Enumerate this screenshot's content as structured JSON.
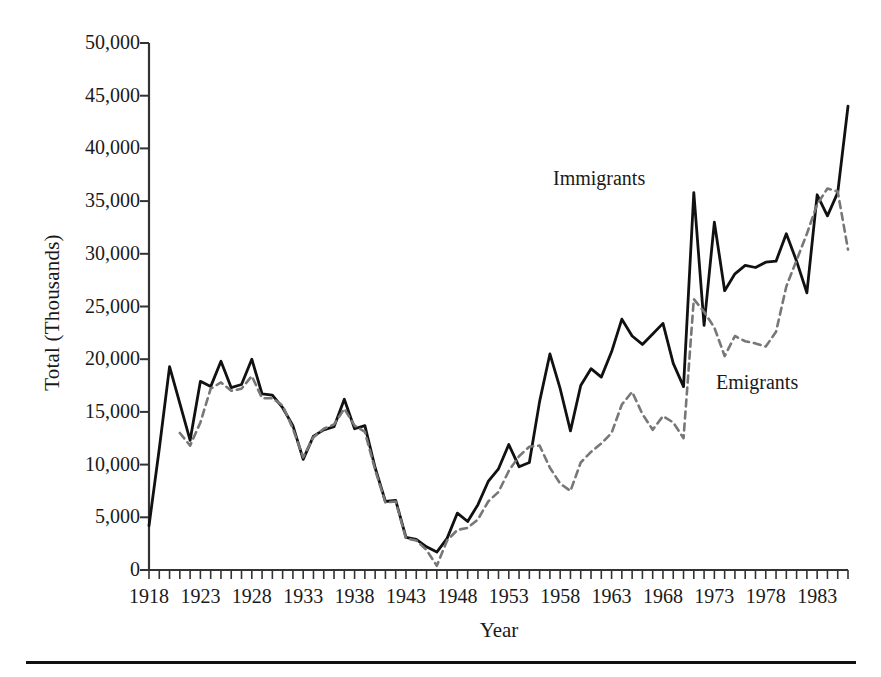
{
  "axes": {
    "ylabel": "Total (Thousands)",
    "xlabel": "Year",
    "y_ticks": [
      "0",
      "5,000",
      "10,000",
      "15,000",
      "20,000",
      "25,000",
      "30,000",
      "35,000",
      "40,000",
      "45,000",
      "50,000"
    ],
    "x_ticks": [
      "1918",
      "1923",
      "1928",
      "1933",
      "1938",
      "1943",
      "1948",
      "1953",
      "1958",
      "1963",
      "1968",
      "1973",
      "1978",
      "1983"
    ]
  },
  "annotations": {
    "immigrants": "Immigrants",
    "emigrants": "Emigrants"
  },
  "colors": {
    "immigrants_line": "#111111",
    "emigrants_line": "#777777",
    "axis": "#333333",
    "background": "#ffffff"
  },
  "chart_data": {
    "type": "line",
    "title": "",
    "xlabel": "Year",
    "ylabel": "Total (Thousands)",
    "xlim": [
      1918,
      1986
    ],
    "ylim": [
      0,
      50000
    ],
    "ytick_step": 5000,
    "xtick_step_major": 5,
    "xtick_step_minor": 1,
    "grid": false,
    "legend": "inline-annotations",
    "x": [
      1918,
      1919,
      1920,
      1921,
      1922,
      1923,
      1924,
      1925,
      1926,
      1927,
      1928,
      1929,
      1930,
      1931,
      1932,
      1933,
      1934,
      1935,
      1936,
      1937,
      1938,
      1939,
      1940,
      1941,
      1942,
      1943,
      1944,
      1945,
      1946,
      1947,
      1948,
      1949,
      1950,
      1951,
      1952,
      1953,
      1954,
      1955,
      1956,
      1957,
      1958,
      1959,
      1960,
      1961,
      1962,
      1963,
      1964,
      1965,
      1966,
      1967,
      1968,
      1969,
      1970,
      1971,
      1972,
      1973,
      1974,
      1975,
      1976,
      1977,
      1978,
      1979,
      1980,
      1981,
      1982,
      1983,
      1984,
      1985,
      1986
    ],
    "series": [
      {
        "name": "Immigrants",
        "style": "solid",
        "color": "#111111",
        "values": [
          4200,
          11500,
          19300,
          15800,
          12300,
          17900,
          17400,
          19800,
          17300,
          17600,
          20000,
          16700,
          16600,
          15400,
          13700,
          10500,
          12700,
          13300,
          13600,
          16200,
          13400,
          13700,
          9700,
          6500,
          6600,
          3100,
          2900,
          2200,
          1700,
          3000,
          5400,
          4600,
          6200,
          8400,
          9600,
          11900,
          9800,
          10200,
          16000,
          20500,
          17200,
          13200,
          17500,
          19100,
          18300,
          20700,
          23800,
          22200,
          21400,
          22400,
          23400,
          19600,
          17400,
          35800,
          23200,
          33000,
          26500,
          28100,
          28900,
          28700,
          29200,
          29300,
          31900,
          29300,
          26300,
          35600,
          33600,
          35800,
          44000
        ]
      },
      {
        "name": "Emigrants",
        "style": "dashed",
        "color": "#777777",
        "values": [
          null,
          null,
          null,
          13000,
          11800,
          14000,
          17200,
          17800,
          17000,
          17200,
          18400,
          16300,
          16300,
          15600,
          13400,
          10700,
          12600,
          13400,
          13800,
          15300,
          13700,
          13100,
          9500,
          6400,
          6500,
          3000,
          2800,
          1900,
          400,
          2800,
          3800,
          4000,
          4800,
          6500,
          7400,
          9400,
          10800,
          11700,
          11800,
          9700,
          8200,
          7500,
          10200,
          11200,
          12000,
          13000,
          15700,
          16900,
          14800,
          13300,
          14600,
          14000,
          12500,
          25700,
          24500,
          23000,
          20300,
          22200,
          21700,
          21500,
          21200,
          22600,
          26900,
          29400,
          31900,
          34700,
          36200,
          35900,
          30400
        ]
      }
    ]
  },
  "layout": {
    "plot_left_px": 149,
    "plot_right_px": 848,
    "plot_bottom_px": 570,
    "plot_top_px": 43
  }
}
